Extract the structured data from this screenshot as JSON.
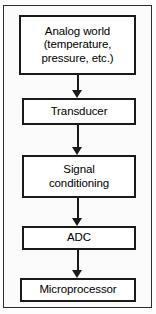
{
  "diagram": {
    "orientation": "vertical-top-to-bottom",
    "colors": {
      "box_border": "#1a1a1a",
      "box_fill": "#ffffff",
      "text": "#000000",
      "arrow": "#1a1a1a",
      "frame_border": "#2b2b2b",
      "page_background": "#fbfbfb"
    },
    "nodes": [
      {
        "id": "analog-world",
        "lines": [
          "Analog world",
          "(temperature,",
          "pressure, etc.)"
        ]
      },
      {
        "id": "transducer",
        "lines": [
          "Transducer"
        ]
      },
      {
        "id": "signal-conditioning",
        "lines": [
          "Signal",
          "conditioning"
        ]
      },
      {
        "id": "adc",
        "lines": [
          "ADC"
        ]
      },
      {
        "id": "microprocessor",
        "lines": [
          "Microprocessor"
        ]
      }
    ],
    "arrows": [
      {
        "id": "arrow-analog-to-transducer",
        "from": "analog-world",
        "to": "transducer",
        "glyph": "down-arrow"
      },
      {
        "id": "arrow-transducer-to-conditioning",
        "from": "transducer",
        "to": "signal-conditioning",
        "glyph": "down-arrow"
      },
      {
        "id": "arrow-conditioning-to-adc",
        "from": "signal-conditioning",
        "to": "adc",
        "glyph": "down-arrow"
      },
      {
        "id": "arrow-adc-to-microprocessor",
        "from": "adc",
        "to": "microprocessor",
        "glyph": "down-arrow"
      }
    ]
  }
}
